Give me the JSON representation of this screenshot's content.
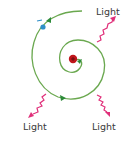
{
  "diagram": {
    "labels": {
      "light_top_right": "Light",
      "light_bottom_left": "Light",
      "light_bottom_right": "Light"
    },
    "colors": {
      "spiral": "#6aa84f",
      "arrow": "#2e8b3a",
      "electron": "#2f8fc8",
      "nucleus": "#c0161c",
      "light_wave": "#e0307a",
      "text": "#3a3a3a"
    },
    "elements": {
      "electron_symbol": "-",
      "nucleus_symbol": "+"
    }
  }
}
